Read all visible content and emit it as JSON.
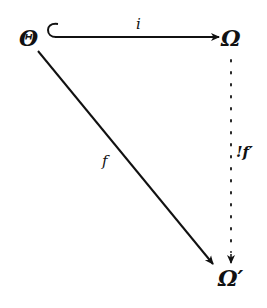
{
  "diagram": {
    "type": "commutative-diagram",
    "nodes": {
      "theta": "Θ",
      "omega": "Ω",
      "omega_prime": "Ω′"
    },
    "edges": [
      {
        "id": "inclusion",
        "from": "Θ",
        "to": "Ω",
        "label": "i",
        "style": "hook-arrow (inclusion)"
      },
      {
        "id": "map-f",
        "from": "Θ",
        "to": "Ω′",
        "label": "f",
        "style": "solid arrow"
      },
      {
        "id": "unique-f-prime",
        "from": "Ω",
        "to": "Ω′",
        "label": "!f′",
        "style": "dotted arrow (unique)"
      }
    ],
    "colors": {
      "ink": "#111111",
      "background": "#ffffff"
    }
  }
}
